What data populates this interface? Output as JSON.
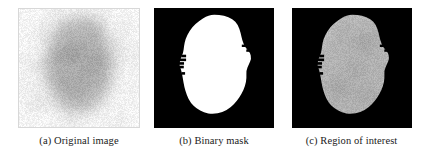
{
  "figure": {
    "type": "image-panel-figure",
    "background_color": "#ffffff",
    "panel_count": 3,
    "text_color": "#1a1a1a"
  },
  "panels": [
    {
      "id": "a",
      "label": "(a) Original image",
      "caption_prefix": "(a)",
      "caption_text": "Original image",
      "content_kind": "grayscale-photograph",
      "background_color": "#ffffff",
      "border_color": "#d8d8d8",
      "base_gray": "#efefef",
      "lesion_gray": "#a8a8a8",
      "lesion_core_gray": "#8c8c8c",
      "noise_amount": 0.1
    },
    {
      "id": "b",
      "label": "(b) Binary mask",
      "caption_prefix": "(b)",
      "caption_text": "Binary mask",
      "content_kind": "binary-mask",
      "background_color": "#000000",
      "mask_color": "#ffffff",
      "border_color": "#000000",
      "noise_amount": 0.0
    },
    {
      "id": "c",
      "label": "(c) Region of interest",
      "caption_prefix": "(c)",
      "caption_text": "Region of interest",
      "content_kind": "masked-grayscale",
      "background_color": "#000000",
      "lesion_gray": "#b4b4b4",
      "lesion_core_gray": "#9a9a9a",
      "border_color": "#000000",
      "noise_amount": 0.09
    }
  ],
  "lesion_shape": {
    "description": "irregular rounded lesion blob, slightly taller than wide, ragged left edge",
    "outline_points": [
      [
        0.5,
        0.055
      ],
      [
        0.585,
        0.063
      ],
      [
        0.655,
        0.09
      ],
      [
        0.7,
        0.14
      ],
      [
        0.722,
        0.205
      ],
      [
        0.735,
        0.27
      ],
      [
        0.76,
        0.33
      ],
      [
        0.8,
        0.37
      ],
      [
        0.812,
        0.42
      ],
      [
        0.79,
        0.47
      ],
      [
        0.768,
        0.52
      ],
      [
        0.772,
        0.585
      ],
      [
        0.76,
        0.65
      ],
      [
        0.73,
        0.715
      ],
      [
        0.69,
        0.775
      ],
      [
        0.64,
        0.83
      ],
      [
        0.57,
        0.87
      ],
      [
        0.49,
        0.885
      ],
      [
        0.415,
        0.872
      ],
      [
        0.355,
        0.838
      ],
      [
        0.305,
        0.79
      ],
      [
        0.272,
        0.725
      ],
      [
        0.252,
        0.655
      ],
      [
        0.24,
        0.585
      ],
      [
        0.228,
        0.52
      ],
      [
        0.21,
        0.47
      ],
      [
        0.222,
        0.42
      ],
      [
        0.244,
        0.372
      ],
      [
        0.25,
        0.318
      ],
      [
        0.262,
        0.258
      ],
      [
        0.295,
        0.192
      ],
      [
        0.345,
        0.13
      ],
      [
        0.41,
        0.085
      ],
      [
        0.455,
        0.062
      ]
    ],
    "left_notches": [
      {
        "y": 0.4,
        "depth": 0.028
      },
      {
        "y": 0.432,
        "depth": 0.04
      },
      {
        "y": 0.462,
        "depth": 0.03
      },
      {
        "y": 0.492,
        "depth": 0.022
      },
      {
        "y": 0.545,
        "depth": 0.018
      }
    ],
    "right_notches": [
      {
        "y": 0.315,
        "depth": 0.022
      },
      {
        "y": 0.355,
        "depth": 0.016
      }
    ],
    "dark_spots": [
      {
        "cx": 0.47,
        "cy": 0.3,
        "r": 0.17,
        "strength": 0.22
      },
      {
        "cx": 0.56,
        "cy": 0.52,
        "r": 0.13,
        "strength": 0.26
      },
      {
        "cx": 0.4,
        "cy": 0.6,
        "r": 0.12,
        "strength": 0.18
      },
      {
        "cx": 0.62,
        "cy": 0.24,
        "r": 0.1,
        "strength": 0.2
      },
      {
        "cx": 0.36,
        "cy": 0.4,
        "r": 0.11,
        "strength": 0.16
      },
      {
        "cx": 0.52,
        "cy": 0.72,
        "r": 0.11,
        "strength": 0.14
      }
    ]
  },
  "captions": {
    "a": "(a) Original image",
    "b": "(b) Binary mask",
    "c": "(c) Region of interest"
  }
}
